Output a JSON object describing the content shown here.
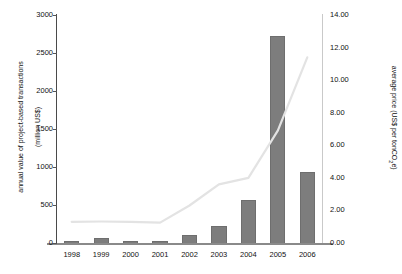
{
  "chart_data": {
    "type": "bar",
    "title": "",
    "categories": [
      "1998",
      "1999",
      "2000",
      "2001",
      "2002",
      "2003",
      "2004",
      "2005",
      "2006"
    ],
    "xlabel": "",
    "ylabel": "annual value of project-based transactions (million US$)",
    "ylim": [
      0,
      3000
    ],
    "yticks": [
      "0",
      "500",
      "1000",
      "1500",
      "2000",
      "2500",
      "3000"
    ],
    "ylabel2": "average price (US$ per tonCO2e)",
    "ylim2": [
      0,
      14
    ],
    "yticks2": [
      "0.00",
      "2.00",
      "4.00",
      "6.00",
      "8.00",
      "10.00",
      "12.00",
      "14.00"
    ],
    "grid": false,
    "legend": "none",
    "series": [
      {
        "name": "annual value of project-based transactions (million US$)",
        "type": "bar",
        "axis": "left",
        "color": "#7d7d7d",
        "values": [
          30,
          60,
          30,
          30,
          100,
          225,
          570,
          2730,
          940
        ]
      },
      {
        "name": "average price (US$ per tonCO2e)",
        "type": "line",
        "axis": "right",
        "color": "#e3e3e3",
        "values": [
          1.3,
          1.32,
          1.3,
          1.25,
          2.3,
          3.6,
          4.0,
          6.9,
          11.4
        ]
      }
    ]
  },
  "axes": {
    "left_title_line1": "annual value of project-based transactions",
    "left_title_line2": "(million US$)",
    "right_title_prefix": "average price (US$ per tonCO",
    "right_title_sub": "2",
    "right_title_suffix": "e)"
  }
}
